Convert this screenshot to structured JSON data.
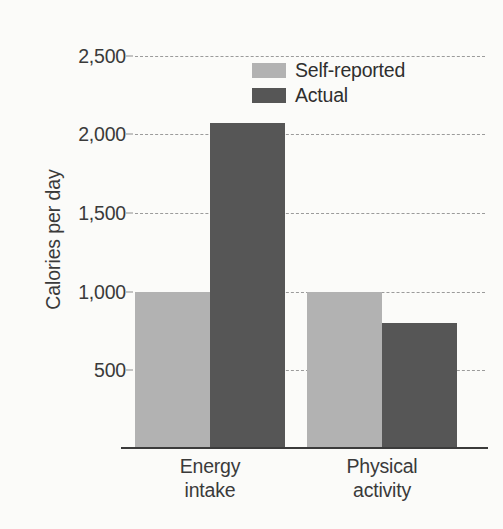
{
  "chart_data": {
    "type": "bar",
    "title": "",
    "xlabel": "",
    "ylabel": "Calories per day",
    "categories": [
      "Energy intake",
      "Physical activity"
    ],
    "category_lines": [
      [
        "Energy",
        "intake"
      ],
      [
        "Physical",
        "activity"
      ]
    ],
    "series": [
      {
        "name": "Self-reported",
        "color": "#b2b2b2",
        "values": [
          1000,
          1000
        ]
      },
      {
        "name": "Actual",
        "color": "#565656",
        "values": [
          2075,
          800
        ]
      }
    ],
    "ylim": [
      0,
      2600
    ],
    "yticks": [
      500,
      1000,
      1500,
      2000,
      2500
    ],
    "ytick_labels": [
      "500",
      "1,000",
      "1,500",
      "2,000",
      "2,500"
    ],
    "grid": "horizontal-dashed",
    "legend_position": "top-right-inside",
    "background_color": "#fbfbf9",
    "axis_color": "#3b3b3b",
    "gridline_color": "#9b9b9b"
  },
  "axis": {
    "y_title": "Calories per day"
  },
  "legend": {
    "entries": [
      {
        "label": "Self-reported",
        "color": "#b2b2b2"
      },
      {
        "label": "Actual",
        "color": "#565656"
      }
    ]
  }
}
